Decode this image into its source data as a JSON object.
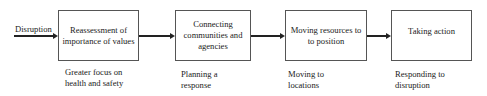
{
  "diagram": {
    "input_label": "Disruption",
    "stages": [
      {
        "title_lines": [
          "Reassessment of",
          "importance of values"
        ],
        "caption_lines": [
          "Greater focus on",
          "health and safety"
        ]
      },
      {
        "title_lines": [
          "Connecting",
          "communities and",
          "agencies"
        ],
        "caption_lines": [
          "Planning a",
          "response"
        ]
      },
      {
        "title_lines": [
          "Moving resources to",
          "to position"
        ],
        "caption_lines": [
          "Moving to",
          "locations"
        ]
      },
      {
        "title_lines": [
          "Taking action"
        ],
        "caption_lines": [
          "Responding to",
          "disruption"
        ]
      }
    ],
    "colors": {
      "line": "#222222",
      "box_border": "#555555",
      "background": "#ffffff"
    }
  }
}
